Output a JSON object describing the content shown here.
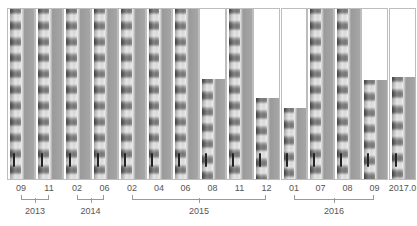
{
  "figure": {
    "panels": [
      {
        "label": "09",
        "x": 7,
        "w": 28,
        "img_top": 0
      },
      {
        "label": "11",
        "x": 35,
        "w": 28,
        "img_top": 0
      },
      {
        "label": "02",
        "x": 63,
        "w": 28,
        "img_top": 0
      },
      {
        "label": "06",
        "x": 91,
        "w": 27,
        "img_top": 0
      },
      {
        "label": "02",
        "x": 118,
        "w": 28,
        "img_top": 0
      },
      {
        "label": "04",
        "x": 146,
        "w": 26,
        "img_top": 0
      },
      {
        "label": "06",
        "x": 172,
        "w": 27,
        "img_top": 0
      },
      {
        "label": "08",
        "x": 199,
        "w": 27,
        "img_top": 70
      },
      {
        "label": "11",
        "x": 226,
        "w": 27,
        "img_top": 0
      },
      {
        "label": "12",
        "x": 253,
        "w": 27,
        "img_top": 89
      },
      {
        "label": "01",
        "x": 281,
        "w": 26,
        "img_top": 99
      },
      {
        "label": "07",
        "x": 307,
        "w": 27,
        "img_top": 0
      },
      {
        "label": "08",
        "x": 334,
        "w": 27,
        "img_top": 0
      },
      {
        "label": "09",
        "x": 361,
        "w": 27,
        "img_top": 71
      },
      {
        "label": "2017.0",
        "x": 389,
        "w": 27,
        "img_top": 68
      }
    ],
    "years": [
      {
        "label": "2013",
        "x1": 21,
        "x2": 49
      },
      {
        "label": "2014",
        "x1": 77,
        "x2": 104
      },
      {
        "label": "2015",
        "x1": 132,
        "x2": 266
      },
      {
        "label": "2016",
        "x1": 294,
        "x2": 374
      }
    ]
  }
}
